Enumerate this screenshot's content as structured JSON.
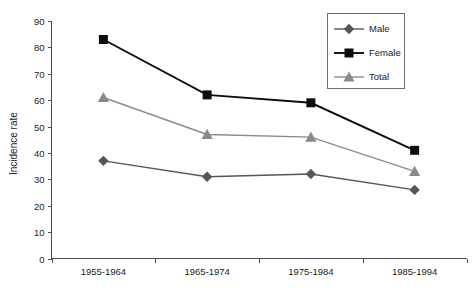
{
  "chart_data": {
    "type": "line",
    "title": "",
    "xlabel": "",
    "ylabel": "Incidence rate",
    "categories": [
      "1955-1964",
      "1965-1974",
      "1975-1984",
      "1985-1994"
    ],
    "series": [
      {
        "name": "Male",
        "values": [
          37,
          31,
          32,
          26
        ],
        "marker": "diamond",
        "color": "#565656"
      },
      {
        "name": "Female",
        "values": [
          83,
          62,
          59,
          41
        ],
        "marker": "square",
        "color": "#0d0d0d"
      },
      {
        "name": "Total",
        "values": [
          61,
          47,
          46,
          33
        ],
        "marker": "triangle",
        "color": "#8a8a8a"
      }
    ],
    "ylim": [
      0,
      90
    ],
    "yticks": [
      0,
      10,
      20,
      30,
      40,
      50,
      60,
      70,
      80,
      90
    ],
    "ytick_labels": [
      "0",
      "10",
      "20",
      "30",
      "40",
      "50",
      "60",
      "70",
      "80",
      "90"
    ],
    "grid": false,
    "legend_position": "top-right",
    "legend_entries": [
      "Male",
      "Female",
      "Total"
    ]
  },
  "axes": {
    "y_axis_title": "Incidence rate"
  },
  "legend": {
    "items": [
      {
        "label": "Male"
      },
      {
        "label": "Female"
      },
      {
        "label": "Total"
      }
    ]
  }
}
